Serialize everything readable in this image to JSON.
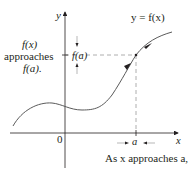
{
  "diagram": {
    "curve_label": "y = f(x)",
    "axes": {
      "x_label": "x",
      "y_label": "y",
      "origin_label": "0"
    },
    "left_annotation": {
      "line1": "f(x)",
      "line2": "approaches",
      "line3": "f(a)."
    },
    "y_axis_point_label": "f(a)",
    "x_axis_point_label": "a",
    "caption": "As x approaches a,",
    "colors": {
      "ink": "#231f20",
      "curve": "#5a5a5a",
      "dashed": "#9a9a9a"
    }
  }
}
